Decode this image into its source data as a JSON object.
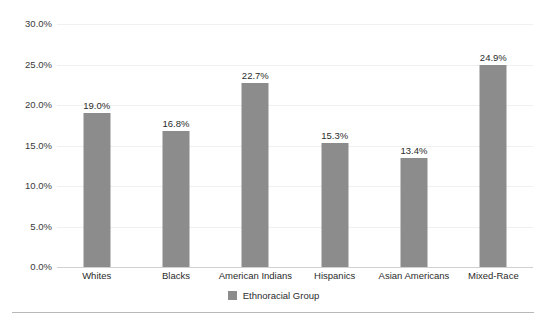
{
  "chart_data": {
    "type": "bar",
    "title": "",
    "subtitle": "",
    "xlabel": "",
    "ylabel": "",
    "categories": [
      "Whites",
      "Blacks",
      "American Indians",
      "Hispanics",
      "Asian Americans",
      "Mixed-Race"
    ],
    "values": [
      19.0,
      16.8,
      22.7,
      15.3,
      13.4,
      24.9
    ],
    "value_labels": [
      "19.0%",
      "16.8%",
      "22.7%",
      "15.3%",
      "13.4%",
      "24.9%"
    ],
    "ylim": [
      0,
      30
    ],
    "ytick_values": [
      0,
      5,
      10,
      15,
      20,
      25,
      30
    ],
    "ytick_labels": [
      "0.0%",
      "5.0%",
      "10.0%",
      "15.0%",
      "20.0%",
      "25.0%",
      "30.0%"
    ],
    "grid": true,
    "legend_position": "bottom",
    "series": [
      {
        "name": "Ethnoracial Group",
        "color": "#8c8c8c",
        "values": [
          19.0,
          16.8,
          22.7,
          15.3,
          13.4,
          24.9
        ]
      }
    ]
  },
  "legend": {
    "entries": [
      {
        "label": "Ethnoracial Group",
        "color": "#8c8c8c"
      }
    ]
  },
  "colors": {
    "bar": "#8c8c8c",
    "gridline": "#f0f0f0",
    "baseline": "#d0d0d0",
    "rule": "#b8b8b8",
    "text": "#2b2b2b",
    "background": "#ffffff"
  }
}
